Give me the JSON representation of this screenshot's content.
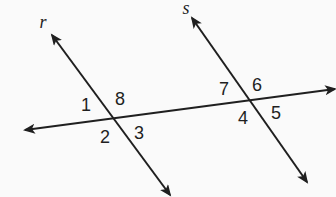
{
  "diagram": {
    "type": "geometry-parallel-lines-transversal",
    "width": 336,
    "height": 197,
    "background": "#fafafa",
    "stroke_color": "#1f1f1f",
    "label_color": "#1f1f1f",
    "stroke_width": 2,
    "lines": [
      {
        "name": "line-r",
        "x1": 52,
        "y1": 35,
        "x2": 170,
        "y2": 195,
        "arrow_start": true,
        "arrow_end": true
      },
      {
        "name": "line-s",
        "x1": 192,
        "y1": 18,
        "x2": 307,
        "y2": 182,
        "arrow_start": true,
        "arrow_end": true
      },
      {
        "name": "transversal-line",
        "x1": 25,
        "y1": 130,
        "x2": 335,
        "y2": 89,
        "arrow_start": true,
        "arrow_end": true
      }
    ],
    "line_labels": [
      {
        "name": "line-r-label",
        "text": "r",
        "x": 43,
        "y": 28
      },
      {
        "name": "line-s-label",
        "text": "s",
        "x": 186,
        "y": 14
      }
    ],
    "angle_labels": [
      {
        "name": "angle-label-1",
        "text": "1",
        "x": 86,
        "y": 111
      },
      {
        "name": "angle-label-8",
        "text": "8",
        "x": 120,
        "y": 105
      },
      {
        "name": "angle-label-2",
        "text": "2",
        "x": 105,
        "y": 143
      },
      {
        "name": "angle-label-3",
        "text": "3",
        "x": 139,
        "y": 139
      },
      {
        "name": "angle-label-7",
        "text": "7",
        "x": 224,
        "y": 95
      },
      {
        "name": "angle-label-6",
        "text": "6",
        "x": 257,
        "y": 91
      },
      {
        "name": "angle-label-4",
        "text": "4",
        "x": 243,
        "y": 124
      },
      {
        "name": "angle-label-5",
        "text": "5",
        "x": 276,
        "y": 119
      }
    ]
  }
}
